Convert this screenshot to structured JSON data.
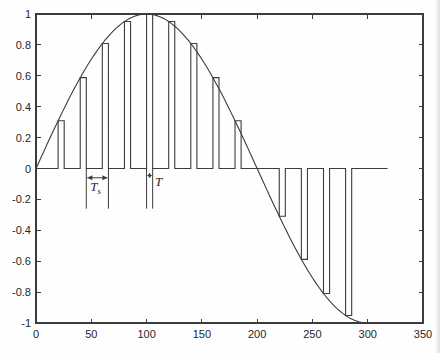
{
  "figure": {
    "background": "#fefefe",
    "frame_color": "#3c3c3c",
    "line_color": "#3c3c3c",
    "text_color": "#262626"
  },
  "chart_data": {
    "type": "line",
    "title": "",
    "xlabel": "",
    "ylabel": "",
    "xlim": [
      0,
      350
    ],
    "ylim": [
      -1,
      1
    ],
    "grid": false,
    "box": true,
    "legend": null,
    "xticks": [
      0,
      50,
      100,
      150,
      200,
      250,
      300,
      350
    ],
    "xtick_labels": [
      "0",
      "50",
      "100",
      "150",
      "200",
      "250",
      "300",
      "350"
    ],
    "yticks": [
      1,
      0.8,
      0.6,
      0.4,
      0.2,
      0,
      -0.2,
      -0.4,
      -0.6,
      -0.8,
      -1
    ],
    "ytick_labels": [
      "1",
      "0.8",
      "0.6",
      "0.4",
      "0.2",
      "0",
      "-0.2",
      "-0.4",
      "-0.6",
      "-0.8",
      "-1"
    ],
    "series": [
      {
        "name": "message-signal-sine",
        "type": "function",
        "fn": "sine",
        "amplitude": 1,
        "period": 400,
        "x_start": 0,
        "x_end": 302
      },
      {
        "name": "flat-top-pam-pulse-train",
        "type": "pulse-train",
        "sample_period": 20,
        "pulse_width": 5.5,
        "baseline": 0,
        "baseline_start": 0,
        "baseline_end": 318,
        "samples": [
          {
            "x": 20,
            "value": 0.309
          },
          {
            "x": 40,
            "value": 0.588
          },
          {
            "x": 60,
            "value": 0.809
          },
          {
            "x": 80,
            "value": 0.951
          },
          {
            "x": 100,
            "value": 1.0
          },
          {
            "x": 120,
            "value": 0.951
          },
          {
            "x": 140,
            "value": 0.809
          },
          {
            "x": 160,
            "value": 0.588
          },
          {
            "x": 180,
            "value": 0.309
          },
          {
            "x": 200,
            "value": 0.0
          },
          {
            "x": 220,
            "value": -0.309
          },
          {
            "x": 240,
            "value": -0.588
          },
          {
            "x": 260,
            "value": -0.809
          },
          {
            "x": 280,
            "value": -0.951
          }
        ]
      }
    ],
    "annotations": {
      "sampling_period_marker": {
        "label_main": "T",
        "label_sub": "s",
        "x1": 45.5,
        "x2": 65.5,
        "v_top": 0,
        "v_bottom": -0.26,
        "arrow_v": -0.06,
        "label_x": 54,
        "label_v": -0.145
      },
      "pulse_width_marker": {
        "label_main": "T",
        "label_sub": "",
        "x1": 100,
        "x2": 105.5,
        "v_top": 0,
        "v_bottom": -0.26,
        "arrow_v": -0.045,
        "label_x": 111,
        "label_v": -0.115
      }
    }
  }
}
